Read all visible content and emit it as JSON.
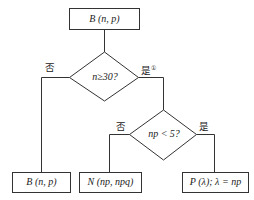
{
  "nodes": {
    "start": {
      "text": "B (n, p)"
    },
    "decision1": {
      "text": "n≥30?"
    },
    "decision2": {
      "text": "np < 5?"
    },
    "out_binomial": {
      "text": "B (n, p)"
    },
    "out_normal": {
      "text": "N (np, npq)"
    },
    "out_poisson": {
      "text": "P (λ); λ = np"
    }
  },
  "edges": {
    "d1_no": "否",
    "d1_yes": "是",
    "d1_yes_note": "①",
    "d2_no": "否",
    "d2_yes": "是"
  },
  "colors": {
    "line": "#333333",
    "background": "#ffffff"
  }
}
